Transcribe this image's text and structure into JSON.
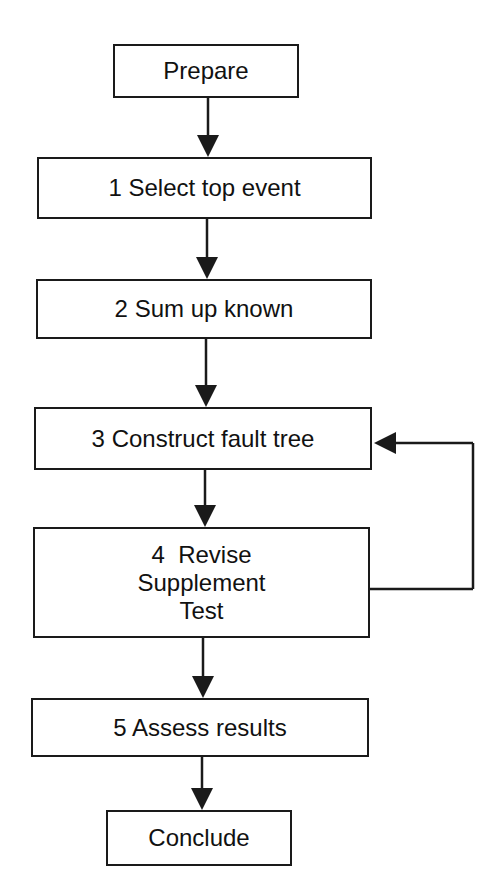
{
  "diagram": {
    "type": "flowchart",
    "colors": {
      "stroke": "#1a1a1a",
      "background": "#ffffff",
      "text": "#111111"
    },
    "nodes": [
      {
        "id": "prepare",
        "lines": [
          "Prepare"
        ],
        "x": 113,
        "y": 44,
        "w": 186,
        "h": 54
      },
      {
        "id": "step1",
        "lines": [
          "1 Select top event"
        ],
        "x": 37,
        "y": 157,
        "w": 335,
        "h": 62
      },
      {
        "id": "step2",
        "lines": [
          "2 Sum up known"
        ],
        "x": 36,
        "y": 279,
        "w": 336,
        "h": 60
      },
      {
        "id": "step3",
        "lines": [
          "3 Construct fault tree"
        ],
        "x": 34,
        "y": 407,
        "w": 338,
        "h": 63
      },
      {
        "id": "step4",
        "lines": [
          "4  Revise",
          "Supplement",
          "Test"
        ],
        "x": 33,
        "y": 527,
        "w": 337,
        "h": 111
      },
      {
        "id": "step5",
        "lines": [
          "5 Assess results"
        ],
        "x": 31,
        "y": 698,
        "w": 338,
        "h": 59
      },
      {
        "id": "conclude",
        "lines": [
          "Conclude"
        ],
        "x": 106,
        "y": 810,
        "w": 186,
        "h": 56
      }
    ],
    "edges": [
      {
        "from": "prepare",
        "to": "step1",
        "type": "down"
      },
      {
        "from": "step1",
        "to": "step2",
        "type": "down"
      },
      {
        "from": "step2",
        "to": "step3",
        "type": "down"
      },
      {
        "from": "step3",
        "to": "step4",
        "type": "down"
      },
      {
        "from": "step4",
        "to": "step5",
        "type": "down"
      },
      {
        "from": "step5",
        "to": "conclude",
        "type": "down"
      },
      {
        "from": "step4",
        "to": "step3",
        "type": "feedback-loop",
        "path": [
          [
            370,
            589
          ],
          [
            473,
            589
          ],
          [
            473,
            443
          ],
          [
            374,
            443
          ]
        ]
      }
    ]
  }
}
